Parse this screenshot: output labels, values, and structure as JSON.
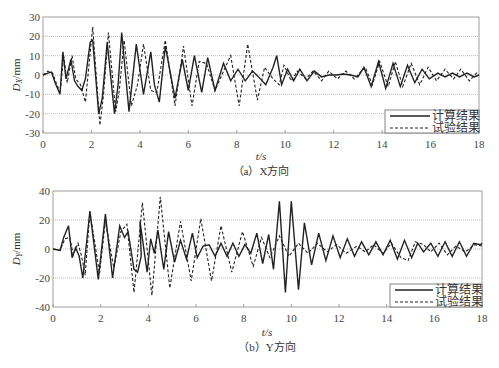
{
  "chart_data": [
    {
      "type": "line",
      "caption": "（a）X方向",
      "xlabel": "t/s",
      "ylabel": "D_X/mm",
      "ylabel_main": "D",
      "ylabel_sub": "X",
      "ylabel_unit": "/mm",
      "xlim": [
        0,
        18
      ],
      "ylim": [
        -30,
        30
      ],
      "xticks": [
        0,
        2,
        4,
        6,
        8,
        10,
        12,
        14,
        16,
        18
      ],
      "yticks": [
        30,
        20,
        10,
        0,
        -10,
        -20,
        -30
      ],
      "grid": true,
      "legend_position": "lower right",
      "series": [
        {
          "name": "计算结果",
          "style": "solid",
          "points": [
            [
              0,
              0
            ],
            [
              0.2,
              1
            ],
            [
              0.35,
              1.5
            ],
            [
              0.5,
              -4
            ],
            [
              0.7,
              -10
            ],
            [
              0.82,
              12
            ],
            [
              0.95,
              -2
            ],
            [
              1.15,
              8
            ],
            [
              1.3,
              -3
            ],
            [
              1.45,
              -6
            ],
            [
              1.6,
              -8
            ],
            [
              1.75,
              -2
            ],
            [
              1.95,
              17
            ],
            [
              2.05,
              18
            ],
            [
              2.3,
              -20
            ],
            [
              2.45,
              -12
            ],
            [
              2.65,
              17
            ],
            [
              2.95,
              -20
            ],
            [
              3.1,
              -5
            ],
            [
              3.25,
              22
            ],
            [
              3.55,
              -19
            ],
            [
              3.85,
              16
            ],
            [
              4.15,
              -10
            ],
            [
              4.45,
              12
            ],
            [
              4.6,
              -5
            ],
            [
              4.8,
              -14
            ],
            [
              5.05,
              15
            ],
            [
              5.45,
              -12
            ],
            [
              5.75,
              8
            ],
            [
              6.0,
              -8
            ],
            [
              6.25,
              10
            ],
            [
              6.55,
              -9
            ],
            [
              6.8,
              9
            ],
            [
              7.1,
              -8
            ],
            [
              7.45,
              6
            ],
            [
              7.75,
              -3
            ],
            [
              8.05,
              3
            ],
            [
              8.35,
              -3
            ],
            [
              8.65,
              2
            ],
            [
              8.9,
              -1
            ],
            [
              9.2,
              -5
            ],
            [
              9.5,
              4
            ],
            [
              9.65,
              10
            ],
            [
              9.85,
              -5
            ],
            [
              10.1,
              3
            ],
            [
              10.35,
              -3
            ],
            [
              10.6,
              3
            ],
            [
              10.9,
              -3
            ],
            [
              11.2,
              2
            ],
            [
              11.5,
              -1
            ],
            [
              11.8,
              0
            ],
            [
              12.1,
              0
            ],
            [
              12.4,
              0.5
            ],
            [
              12.7,
              0
            ],
            [
              13.0,
              -1
            ],
            [
              13.25,
              4
            ],
            [
              13.55,
              -6
            ],
            [
              13.85,
              7
            ],
            [
              14.15,
              -7
            ],
            [
              14.45,
              6
            ],
            [
              14.75,
              -6
            ],
            [
              15.05,
              5
            ],
            [
              15.35,
              -4
            ],
            [
              15.65,
              3
            ],
            [
              15.95,
              -2
            ],
            [
              16.3,
              1
            ],
            [
              16.6,
              -1
            ],
            [
              16.9,
              1
            ],
            [
              17.2,
              -1
            ],
            [
              17.5,
              1
            ],
            [
              17.8,
              -1
            ],
            [
              18,
              0
            ]
          ]
        },
        {
          "name": "试验结果",
          "style": "dashed",
          "points": [
            [
              0,
              0
            ],
            [
              0.2,
              2
            ],
            [
              0.4,
              1
            ],
            [
              0.6,
              -6
            ],
            [
              0.72,
              -8
            ],
            [
              0.85,
              10
            ],
            [
              1.0,
              -4
            ],
            [
              1.2,
              10
            ],
            [
              1.35,
              -2
            ],
            [
              1.55,
              -5
            ],
            [
              1.75,
              -14
            ],
            [
              1.9,
              5
            ],
            [
              2.05,
              25
            ],
            [
              2.35,
              -26
            ],
            [
              2.5,
              -10
            ],
            [
              2.7,
              22
            ],
            [
              3.0,
              -19
            ],
            [
              3.15,
              -8
            ],
            [
              3.35,
              18
            ],
            [
              3.65,
              -16
            ],
            [
              3.9,
              -5
            ],
            [
              4.15,
              16
            ],
            [
              4.45,
              -8
            ],
            [
              4.7,
              -9
            ],
            [
              5.05,
              18
            ],
            [
              5.45,
              -16
            ],
            [
              5.8,
              15
            ],
            [
              6.15,
              -16
            ],
            [
              6.45,
              7
            ],
            [
              6.75,
              6
            ],
            [
              7.1,
              -8
            ],
            [
              7.45,
              2
            ],
            [
              7.75,
              10
            ],
            [
              8.1,
              -16
            ],
            [
              8.45,
              16
            ],
            [
              8.85,
              -13
            ],
            [
              9.15,
              4
            ],
            [
              9.5,
              -2
            ],
            [
              9.75,
              -5
            ],
            [
              9.95,
              5
            ],
            [
              10.25,
              -3
            ],
            [
              10.5,
              2
            ],
            [
              10.85,
              -2
            ],
            [
              11.15,
              2
            ],
            [
              11.5,
              -3
            ],
            [
              11.8,
              2
            ],
            [
              12.15,
              -2
            ],
            [
              12.5,
              2
            ],
            [
              12.85,
              -2
            ],
            [
              13.3,
              4
            ],
            [
              13.6,
              -5
            ],
            [
              13.9,
              7
            ],
            [
              14.25,
              -6
            ],
            [
              14.55,
              7
            ],
            [
              14.85,
              -6
            ],
            [
              15.2,
              6
            ],
            [
              15.55,
              -5
            ],
            [
              15.9,
              4
            ],
            [
              16.25,
              -3
            ],
            [
              16.6,
              3
            ],
            [
              16.95,
              -2
            ],
            [
              17.25,
              3
            ],
            [
              17.6,
              -3
            ],
            [
              17.9,
              1
            ],
            [
              18,
              0
            ]
          ]
        }
      ]
    },
    {
      "type": "line",
      "caption": "（b）Y方向",
      "xlabel": "t/s",
      "ylabel": "D_Y/mm",
      "ylabel_main": "D",
      "ylabel_sub": "Y",
      "ylabel_unit": "/mm",
      "xlim": [
        0,
        18
      ],
      "ylim": [
        -40,
        40
      ],
      "xticks": [
        0,
        2,
        4,
        6,
        8,
        10,
        12,
        14,
        16,
        18
      ],
      "yticks": [
        40,
        20,
        0,
        -20,
        -40
      ],
      "grid": true,
      "legend_position": "lower right",
      "series": [
        {
          "name": "计算结果",
          "style": "solid",
          "points": [
            [
              0,
              0
            ],
            [
              0.3,
              -1
            ],
            [
              0.45,
              8
            ],
            [
              0.65,
              16
            ],
            [
              0.8,
              -6
            ],
            [
              0.95,
              1
            ],
            [
              1.1,
              -5
            ],
            [
              1.25,
              -20
            ],
            [
              1.55,
              26
            ],
            [
              1.9,
              -21
            ],
            [
              2.2,
              24
            ],
            [
              2.5,
              -20
            ],
            [
              2.8,
              16
            ],
            [
              3.0,
              8
            ],
            [
              3.15,
              12
            ],
            [
              3.4,
              -14
            ],
            [
              3.55,
              -16
            ],
            [
              3.7,
              -5
            ],
            [
              3.65,
              19
            ],
            [
              3.95,
              -16
            ],
            [
              4.1,
              7
            ],
            [
              4.25,
              -3
            ],
            [
              4.4,
              13
            ],
            [
              4.65,
              -14
            ],
            [
              4.85,
              12
            ],
            [
              5.1,
              -9
            ],
            [
              5.35,
              6
            ],
            [
              5.6,
              -7
            ],
            [
              5.85,
              11
            ],
            [
              6.05,
              -6
            ],
            [
              6.3,
              2
            ],
            [
              6.55,
              3
            ],
            [
              6.8,
              -5
            ],
            [
              7.05,
              4
            ],
            [
              7.3,
              -5
            ],
            [
              7.55,
              4
            ],
            [
              7.8,
              -5
            ],
            [
              8.05,
              3
            ],
            [
              8.3,
              -3
            ],
            [
              8.55,
              11
            ],
            [
              8.8,
              -10
            ],
            [
              9.05,
              10
            ],
            [
              9.25,
              -14
            ],
            [
              9.5,
              33
            ],
            [
              9.75,
              -30
            ],
            [
              10.0,
              33
            ],
            [
              10.3,
              -28
            ],
            [
              10.55,
              18
            ],
            [
              10.85,
              -11
            ],
            [
              11.15,
              11
            ],
            [
              11.45,
              -8
            ],
            [
              11.75,
              9
            ],
            [
              12.05,
              -6
            ],
            [
              12.35,
              7
            ],
            [
              12.65,
              -5
            ],
            [
              12.95,
              5
            ],
            [
              13.25,
              -4
            ],
            [
              13.55,
              5
            ],
            [
              13.85,
              -4
            ],
            [
              14.15,
              6
            ],
            [
              14.45,
              -7
            ],
            [
              14.75,
              6
            ],
            [
              15.05,
              -6
            ],
            [
              15.3,
              4
            ],
            [
              15.55,
              -2
            ],
            [
              15.85,
              4
            ],
            [
              16.15,
              -5
            ],
            [
              16.45,
              5
            ],
            [
              16.75,
              -5
            ],
            [
              17.05,
              5
            ],
            [
              17.35,
              -5
            ],
            [
              17.65,
              4
            ],
            [
              17.95,
              3
            ],
            [
              18,
              4
            ]
          ]
        },
        {
          "name": "试验结果",
          "style": "dashed",
          "points": [
            [
              0,
              0
            ],
            [
              0.3,
              -1
            ],
            [
              0.5,
              7
            ],
            [
              0.7,
              8
            ],
            [
              0.85,
              -4
            ],
            [
              1.05,
              4
            ],
            [
              1.2,
              -5
            ],
            [
              1.35,
              -18
            ],
            [
              1.55,
              26
            ],
            [
              1.95,
              -17
            ],
            [
              2.2,
              19
            ],
            [
              2.55,
              -13
            ],
            [
              2.85,
              12
            ],
            [
              3.1,
              17
            ],
            [
              3.4,
              -30
            ],
            [
              3.75,
              32
            ],
            [
              4.15,
              -32
            ],
            [
              4.5,
              36
            ],
            [
              4.9,
              -27
            ],
            [
              5.35,
              19
            ],
            [
              5.8,
              -22
            ],
            [
              6.2,
              21
            ],
            [
              6.65,
              -22
            ],
            [
              7.05,
              16
            ],
            [
              7.5,
              -16
            ],
            [
              7.95,
              12
            ],
            [
              8.4,
              -12
            ],
            [
              8.75,
              8
            ],
            [
              9.1,
              -6
            ],
            [
              9.5,
              9
            ],
            [
              9.9,
              -5
            ],
            [
              10.3,
              4
            ],
            [
              10.7,
              -3
            ],
            [
              11.1,
              4
            ],
            [
              11.5,
              -2
            ],
            [
              11.9,
              3
            ],
            [
              12.3,
              -3
            ],
            [
              12.75,
              2
            ],
            [
              13.1,
              -2
            ],
            [
              13.45,
              3
            ],
            [
              13.85,
              -3
            ],
            [
              14.2,
              4
            ],
            [
              14.6,
              -6
            ],
            [
              14.9,
              -8
            ],
            [
              15.2,
              5
            ],
            [
              15.55,
              3
            ],
            [
              15.85,
              -2
            ],
            [
              16.2,
              4
            ],
            [
              16.55,
              -4
            ],
            [
              16.9,
              2
            ],
            [
              17.3,
              -2
            ],
            [
              17.7,
              3
            ],
            [
              18,
              2
            ]
          ]
        }
      ]
    }
  ]
}
